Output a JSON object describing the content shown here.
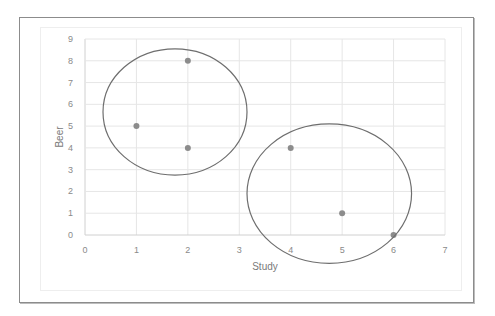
{
  "chart_data": {
    "type": "scatter",
    "title": "",
    "xlabel": "Study",
    "ylabel": "Beer",
    "xlim": [
      0,
      7
    ],
    "ylim": [
      0,
      9
    ],
    "x_ticks": [
      "0",
      "1",
      "2",
      "3",
      "4",
      "5",
      "6",
      "7"
    ],
    "y_ticks": [
      "0",
      "1",
      "2",
      "3",
      "4",
      "5",
      "6",
      "7",
      "8",
      "9"
    ],
    "grid": true,
    "legend": "none",
    "series": [
      {
        "name": "points",
        "color": "#8c8c8c",
        "points": [
          {
            "x": 1,
            "y": 5
          },
          {
            "x": 2,
            "y": 8
          },
          {
            "x": 2,
            "y": 4
          },
          {
            "x": 4,
            "y": 4
          },
          {
            "x": 5,
            "y": 1
          },
          {
            "x": 6,
            "y": 0
          }
        ]
      }
    ],
    "annotations": [
      {
        "type": "ellipse",
        "label": "cluster-1",
        "cx": 1.75,
        "cy": 5.65,
        "rx": 1.4,
        "ry": 2.9,
        "stroke": "#6e6e6e"
      },
      {
        "type": "ellipse",
        "label": "cluster-2",
        "cx": 4.75,
        "cy": 1.9,
        "rx": 1.6,
        "ry": 3.2,
        "stroke": "#6e6e6e"
      }
    ]
  }
}
